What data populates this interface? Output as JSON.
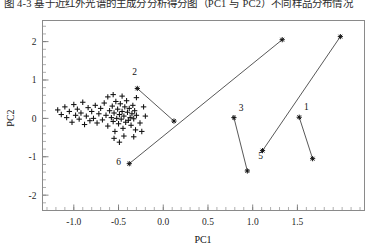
{
  "caption": {
    "text": "图 4-3 基于近红外光谱的主成分分析得分图（PC1 与 PC2）不同样品分布情况",
    "visible_note": "clipped-top-line"
  },
  "figure": {
    "background": "#ffffff",
    "frame_color": "#8a8a8a",
    "marker_color": "#111111",
    "line_color": "#3a3a3a"
  },
  "chart_data": {
    "type": "scatter",
    "title": "",
    "xlabel": "PC1",
    "ylabel": "PC2",
    "xlim": [
      -1.35,
      2.25
    ],
    "ylim": [
      -2.4,
      2.55
    ],
    "xticks": [
      -1.0,
      -0.5,
      0.0,
      0.5,
      1.0,
      1.5
    ],
    "xticklabels": [
      "-1.0",
      "-0.5",
      "0.0",
      "0.5",
      "1.0",
      "1.5"
    ],
    "yticks": [
      -2,
      -1,
      0,
      1,
      2
    ],
    "yticklabels": [
      "-2",
      "-1",
      "0",
      "1",
      "2"
    ],
    "grid": false,
    "legend": null,
    "series": [
      {
        "name": "background-samples",
        "marker": "plus",
        "points": [
          [
            -1.18,
            0.22
          ],
          [
            -1.14,
            0.1
          ],
          [
            -1.1,
            0.3
          ],
          [
            -1.08,
            0.02
          ],
          [
            -1.05,
            0.18
          ],
          [
            -1.02,
            -0.1
          ],
          [
            -1.0,
            0.36
          ],
          [
            -0.98,
            0.08
          ],
          [
            -0.96,
            0.24
          ],
          [
            -0.94,
            -0.02
          ],
          [
            -0.92,
            0.14
          ],
          [
            -0.9,
            0.42
          ],
          [
            -0.88,
            -0.16
          ],
          [
            -0.86,
            0.06
          ],
          [
            -0.84,
            0.28
          ],
          [
            -0.82,
            -0.06
          ],
          [
            -0.8,
            0.18
          ],
          [
            -0.78,
            0.0
          ],
          [
            -0.76,
            0.34
          ],
          [
            -0.74,
            -0.12
          ],
          [
            -0.72,
            0.12
          ],
          [
            -0.7,
            0.26
          ],
          [
            -0.68,
            -0.04
          ],
          [
            -0.66,
            0.4
          ],
          [
            -0.64,
            0.08
          ],
          [
            -0.62,
            -0.2
          ],
          [
            -0.6,
            0.2
          ],
          [
            -0.58,
            0.02
          ],
          [
            -0.57,
            0.32
          ],
          [
            -0.56,
            -0.08
          ],
          [
            -0.55,
            0.14
          ],
          [
            -0.54,
            -0.34
          ],
          [
            -0.53,
            0.44
          ],
          [
            -0.52,
            0.0
          ],
          [
            -0.51,
            0.24
          ],
          [
            -0.5,
            -0.14
          ],
          [
            -0.49,
            0.1
          ],
          [
            -0.48,
            0.38
          ],
          [
            -0.47,
            -0.02
          ],
          [
            -0.46,
            0.18
          ],
          [
            -0.45,
            -0.26
          ],
          [
            -0.44,
            0.06
          ],
          [
            -0.43,
            0.3
          ],
          [
            -0.42,
            -0.1
          ],
          [
            -0.41,
            0.46
          ],
          [
            -0.4,
            0.16
          ],
          [
            -0.39,
            -0.05
          ],
          [
            -0.38,
            0.26
          ],
          [
            -0.37,
            0.02
          ],
          [
            -0.36,
            -0.18
          ],
          [
            -0.35,
            0.12
          ],
          [
            -0.34,
            0.34
          ],
          [
            -0.33,
            -0.01
          ],
          [
            -0.32,
            0.2
          ],
          [
            -0.31,
            -0.3
          ],
          [
            -0.3,
            0.08
          ],
          [
            -0.62,
            0.56
          ],
          [
            -0.56,
            0.62
          ],
          [
            -0.46,
            0.58
          ],
          [
            -0.3,
            0.54
          ],
          [
            -0.55,
            -0.52
          ],
          [
            -0.49,
            -0.62
          ],
          [
            -0.44,
            -0.46
          ],
          [
            -0.33,
            -0.48
          ],
          [
            -0.24,
            -0.34
          ],
          [
            -0.2,
            0.06
          ],
          [
            -0.22,
            0.3
          ],
          [
            -0.26,
            -0.12
          ]
        ]
      },
      {
        "name": "labeled-pairs",
        "marker": "star",
        "pairs": [
          {
            "label": "1",
            "a": [
              1.52,
              0.03
            ],
            "b": [
              1.67,
              -1.05
            ],
            "label_pos": [
              1.6,
              0.22
            ]
          },
          {
            "label": "2",
            "a": [
              -0.29,
              0.78
            ],
            "b": [
              0.12,
              -0.07
            ],
            "label_pos": [
              -0.32,
              1.12
            ]
          },
          {
            "label": "3",
            "a": [
              0.79,
              0.02
            ],
            "b": [
              0.94,
              -1.37
            ],
            "label_pos": [
              0.87,
              0.2
            ]
          },
          {
            "label": "5",
            "a": [
              1.11,
              -0.84
            ],
            "b": [
              1.98,
              2.13
            ],
            "label_pos": [
              1.09,
              -1.06
            ]
          },
          {
            "label": "6",
            "a": [
              -0.38,
              -1.18
            ],
            "b": [
              1.33,
              2.05
            ],
            "label_pos": [
              -0.5,
              -1.22
            ]
          }
        ]
      }
    ]
  }
}
